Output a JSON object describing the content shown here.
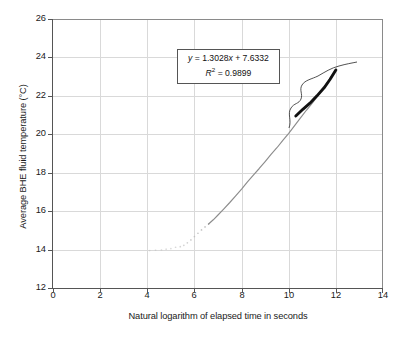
{
  "chart_data": {
    "type": "line",
    "title": "",
    "xlabel": "Natural logarithm of elapsed time in seconds",
    "ylabel": "Average BHE fluid temperature (°C)",
    "xlim": [
      0,
      14
    ],
    "ylim": [
      12,
      26
    ],
    "xticks": [
      0,
      2,
      4,
      6,
      8,
      10,
      12,
      14
    ],
    "yticks": [
      12,
      14,
      16,
      18,
      20,
      22,
      24,
      26
    ],
    "grid": true,
    "legend": "none",
    "series": [
      {
        "name": "Measured average BHE fluid temperature",
        "style": "scattered-dots-then-solid-line",
        "color": "#8c8c8c",
        "points": [
          [
            4.1,
            13.95
          ],
          [
            4.35,
            13.97
          ],
          [
            4.6,
            13.98
          ],
          [
            4.8,
            14.02
          ],
          [
            5.0,
            14.05
          ],
          [
            5.2,
            14.12
          ],
          [
            5.4,
            14.15
          ],
          [
            5.55,
            14.22
          ],
          [
            5.7,
            14.35
          ],
          [
            5.85,
            14.5
          ],
          [
            6.0,
            14.68
          ],
          [
            6.15,
            14.85
          ],
          [
            6.3,
            15.02
          ],
          [
            6.45,
            15.18
          ],
          [
            6.6,
            15.33
          ],
          [
            6.8,
            15.55
          ],
          [
            7.0,
            15.8
          ],
          [
            7.25,
            16.12
          ],
          [
            7.5,
            16.45
          ],
          [
            7.75,
            16.8
          ],
          [
            8.0,
            17.15
          ],
          [
            8.25,
            17.52
          ],
          [
            8.5,
            17.88
          ],
          [
            8.75,
            18.22
          ],
          [
            9.0,
            18.58
          ],
          [
            9.25,
            18.95
          ],
          [
            9.5,
            19.3
          ],
          [
            9.75,
            19.68
          ],
          [
            10.0,
            20.05
          ],
          [
            10.25,
            20.45
          ],
          [
            10.5,
            20.85
          ],
          [
            10.75,
            21.25
          ],
          [
            11.0,
            21.62
          ],
          [
            11.25,
            22.02
          ],
          [
            11.5,
            22.45
          ],
          [
            11.75,
            22.9
          ],
          [
            12.0,
            23.38
          ]
        ]
      },
      {
        "name": "Regression-fitted straight-line portion",
        "style": "thick-solid",
        "color": "#111111",
        "points": [
          [
            10.3,
            20.95
          ],
          [
            10.6,
            21.3
          ],
          [
            10.9,
            21.62
          ],
          [
            11.2,
            22.0
          ],
          [
            11.5,
            22.42
          ],
          [
            11.75,
            22.85
          ],
          [
            12.0,
            23.35
          ]
        ]
      }
    ],
    "annotations": [
      {
        "name": "regression-equation",
        "equation": "y = 1.3028x + 7.6332",
        "equation_parts": {
          "y": "y",
          "eq1": " = 1.3028",
          "x": "x",
          "rest": " + 7.6332"
        },
        "r_squared_parts": {
          "r": "R",
          "exp": "2",
          "rest": " = 0.9899"
        },
        "r_squared": "R2 = 0.9899",
        "slope": 1.3028,
        "intercept": 7.6332,
        "r2": 0.9899
      },
      {
        "name": "brace-marking-fitted-range",
        "type": "curly-brace",
        "covers_x_range": [
          10.2,
          12.0
        ]
      }
    ]
  },
  "colors": {
    "background": "#ffffff",
    "axis": "#555555",
    "grid": "#d9d9d9",
    "data_line": "#8c8c8c",
    "fit_line": "#111111",
    "text": "#1a1a1a"
  }
}
